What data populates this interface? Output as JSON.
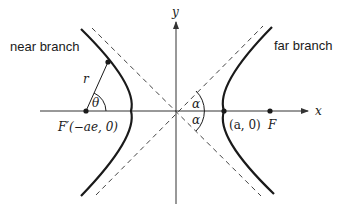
{
  "diagram": {
    "labels": {
      "near_branch": "near branch",
      "far_branch": "far branch",
      "x_axis": "x",
      "y_axis": "y",
      "radius": "r",
      "theta": "θ",
      "alpha_upper": "α",
      "alpha_lower": "α",
      "focus_near": "F′(−ae, 0)",
      "vertex": "(a, 0)",
      "focus_far": "F"
    },
    "colors": {
      "curve": "#1a1a1a",
      "axis": "#333333",
      "asymptote": "#444444",
      "background": "#ffffff"
    }
  }
}
